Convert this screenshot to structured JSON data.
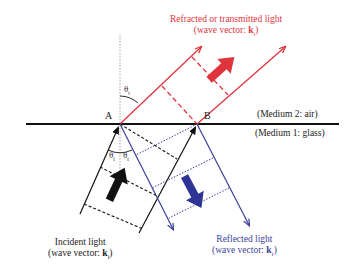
{
  "labels": {
    "refracted_line1": "Refracted or transmitted light",
    "refracted_line2_prefix": "(wave vector: ",
    "refracted_vector": "k",
    "refracted_sub": "t",
    "incident_line1": "Incident light",
    "incident_line2_prefix": "(wave vector: ",
    "incident_vector": "k",
    "incident_sub": "i",
    "reflected_line1": "Reflected light",
    "reflected_line2_prefix": "(wave vector: ",
    "reflected_vector": "k",
    "reflected_sub": "r",
    "close_paren": ")"
  },
  "media": {
    "upper": "(Medium 2: air)",
    "lower": "(Medium 1: glass)"
  },
  "points": {
    "a": "A",
    "b": "B"
  },
  "angles": {
    "theta": "θ",
    "transmitted_sub": "t",
    "incident_sub": "i",
    "reflected_sub": "r"
  },
  "colors": {
    "refracted": "#e0343c",
    "reflected": "#3a3f9a",
    "incident": "#111111",
    "interface": "#111111"
  }
}
